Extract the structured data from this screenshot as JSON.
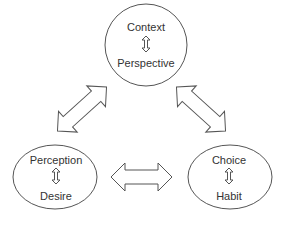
{
  "nodes": {
    "top": {
      "primary": "Context",
      "secondary": "Perspective"
    },
    "left": {
      "primary": "Perception",
      "secondary": "Desire"
    },
    "right": {
      "primary": "Choice",
      "secondary": "Habit"
    }
  },
  "colors": {
    "stroke": "#555555",
    "text": "#333333",
    "background": "#ffffff"
  }
}
